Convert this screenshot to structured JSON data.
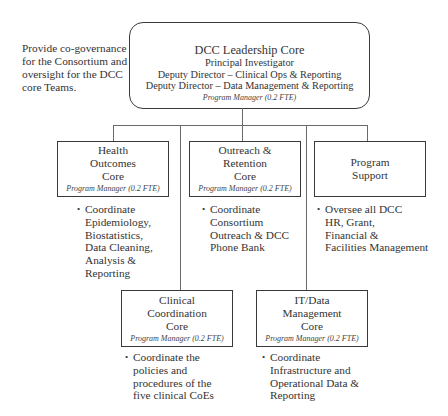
{
  "side_note": "Provide co-governance\nfor the Consortium and\noversight for the DCC\ncore Teams.",
  "leadership": {
    "title": "DCC Leadership Core",
    "lines": [
      "Principal Investigator",
      "Deputy Director – Clinical Ops & Reporting",
      "Deputy Director – Data Management & Reporting"
    ],
    "program_manager": "Program Manager (0.2 FTE)"
  },
  "cores": [
    {
      "name": "Health\nOutcomes\nCore",
      "program_manager": "Program Manager (0.2 FTE)",
      "bullet": "Coordinate\nEpidemiology,\nBiostatistics,\nData Cleaning,\nAnalysis &\nReporting"
    },
    {
      "name": "Outreach &\nRetention\nCore",
      "program_manager": "Program Manager (0.2 FTE)",
      "bullet": "Coordinate\nConsortium\nOutreach & DCC\nPhone Bank"
    },
    {
      "name": "Program\nSupport",
      "program_manager": null,
      "bullet": "Oversee all DCC\nHR, Grant,\nFinancial &\nFacilities Management"
    },
    {
      "name": "Clinical\nCoordination\nCore",
      "program_manager": "Program Manager (0.2 FTE)",
      "bullet": "Coordinate the\npolicies and\nprocedures of the\nfive clinical CoEs"
    },
    {
      "name": "IT/Data\nManagement\nCore",
      "program_manager": "Program Manager (0.2 FTE)",
      "bullet": "Coordinate\nInfrastructure and\nOperational Data &\nReporting"
    }
  ],
  "bullet_glyph": "•"
}
